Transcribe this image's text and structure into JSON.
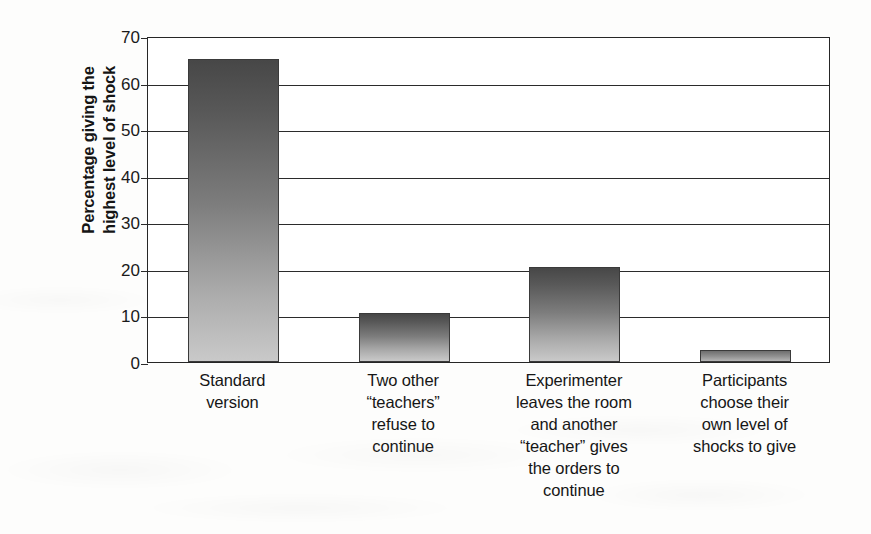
{
  "chart_data": {
    "type": "bar",
    "title": "",
    "xlabel": "",
    "ylabel": "Percentage giving the highest level of shock",
    "ylim": [
      0,
      70
    ],
    "yticks": [
      0,
      10,
      20,
      30,
      40,
      50,
      60,
      70
    ],
    "grid": true,
    "legend": "none",
    "categories": [
      "Standard version",
      "Two other “teachers” refuse to continue",
      "Experimenter leaves the room and another “teacher” gives the orders to continue",
      "Participants choose their own level of shocks to give"
    ],
    "category_lines": [
      [
        "Standard",
        "version"
      ],
      [
        "Two other",
        "“teachers”",
        "refuse to",
        "continue"
      ],
      [
        "Experimenter",
        "leaves the room",
        "and another",
        "“teacher” gives",
        "the orders to",
        "continue"
      ],
      [
        "Participants",
        "choose their",
        "own level of",
        "shocks to give"
      ]
    ],
    "values": [
      65,
      10.5,
      20.5,
      2.5
    ],
    "value_labels": [
      "65",
      "10.5",
      "20.5",
      "2.5"
    ]
  },
  "axis": {
    "y_title_line1": "Percentage giving the",
    "y_title_line2": "highest level of shock",
    "tick_labels": [
      "70",
      "60",
      "50",
      "40",
      "30",
      "20",
      "10",
      "0"
    ]
  },
  "colors": {
    "bar_top": "#474747",
    "bar_bottom": "#c9c9c9",
    "axis_line": "#262626",
    "gridline": "#2b2b2b",
    "text": "#151515",
    "background": "#fdfdfc",
    "plot_background": "#ffffff"
  }
}
